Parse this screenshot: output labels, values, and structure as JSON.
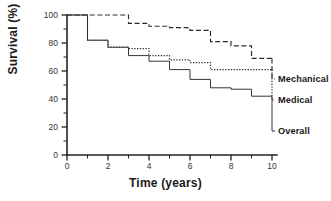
{
  "chart_data": {
    "type": "line",
    "title": "",
    "xlabel": "Time (years)",
    "ylabel": "Survival (%)",
    "xlim": [
      0,
      10
    ],
    "ylim": [
      0,
      100
    ],
    "xticks": [
      0,
      2,
      4,
      6,
      8,
      10
    ],
    "yticks": [
      0,
      20,
      40,
      60,
      80,
      100
    ],
    "xtick_labels": [
      "0",
      "2",
      "4",
      "6",
      "8",
      "10"
    ],
    "ytick_labels": [
      "0",
      "20",
      "40",
      "60",
      "80",
      "100"
    ],
    "xminor_ticks": [
      1,
      3,
      5,
      7,
      9
    ],
    "yminor_ticks": [
      10,
      30,
      50,
      70,
      90
    ],
    "grid": false,
    "legend_position": "right-inline",
    "series": [
      {
        "name": "Mechanical",
        "linestyle": "dashed",
        "color": "#2b2b2b",
        "x": [
          0,
          1,
          2,
          3,
          3,
          4,
          4,
          5,
          5,
          6,
          6,
          7,
          7,
          8,
          8,
          9,
          9,
          10
        ],
        "y": [
          100,
          100,
          100,
          100,
          94,
          94,
          92,
          92,
          91,
          91,
          89,
          89,
          81,
          81,
          78,
          78,
          69,
          69
        ],
        "values_at_ticks": {
          "0": 100,
          "1": 100,
          "2": 100,
          "3": 94,
          "4": 92,
          "5": 91,
          "6": 89,
          "7": 81,
          "8": 78,
          "9": 69,
          "10": 68
        }
      },
      {
        "name": "Medical",
        "linestyle": "dotted",
        "color": "#2b2b2b",
        "x": [
          0,
          1,
          1,
          2,
          2,
          3,
          3,
          4,
          4,
          5,
          5,
          6,
          6,
          7,
          7,
          10
        ],
        "y": [
          100,
          100,
          82,
          82,
          77,
          77,
          76,
          76,
          71,
          71,
          68,
          68,
          66,
          66,
          61,
          61
        ],
        "values_at_ticks": {
          "0": 100,
          "1": 82,
          "2": 77,
          "3": 76,
          "4": 71,
          "5": 68,
          "6": 66,
          "7": 61,
          "8": 61,
          "9": 61,
          "10": 61
        }
      },
      {
        "name": "Overall",
        "linestyle": "solid",
        "color": "#2b2b2b",
        "x": [
          0,
          1,
          1,
          2,
          2,
          3,
          3,
          4,
          4,
          5,
          5,
          6,
          6,
          7,
          7,
          8,
          8,
          9,
          9,
          10
        ],
        "y": [
          100,
          100,
          82,
          82,
          77,
          77,
          71,
          71,
          67,
          67,
          61,
          61,
          54,
          54,
          48,
          48,
          47,
          47,
          42,
          42
        ],
        "values_at_ticks": {
          "0": 100,
          "1": 82,
          "2": 77,
          "3": 71,
          "4": 67,
          "5": 61,
          "6": 54,
          "7": 48,
          "8": 47,
          "9": 42,
          "10": 42
        }
      }
    ]
  },
  "labels": {
    "mechanical": "Mechanical",
    "medical": "Medical",
    "overall": "Overall",
    "xaxis_title": "Time (years)",
    "yaxis_title": "Survival (%)"
  }
}
